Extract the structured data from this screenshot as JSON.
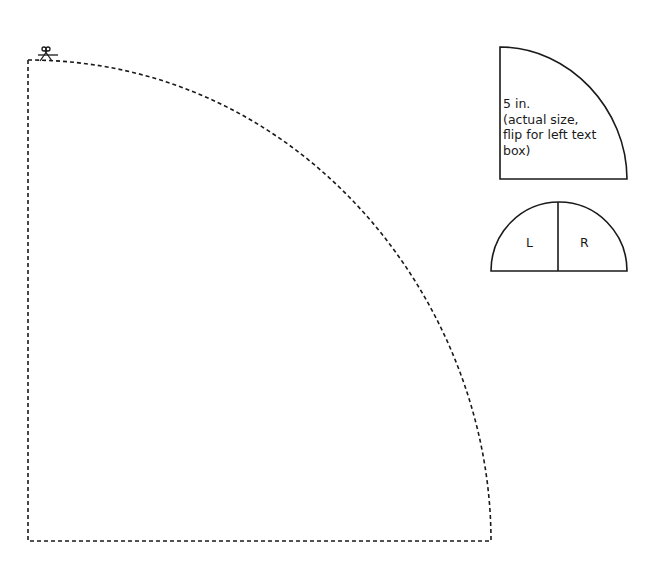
{
  "pattern": {
    "large_template": {
      "shape": "quarter-circle",
      "outline": "dashed",
      "cut_marker_icon": "scissors-icon"
    },
    "small_template": {
      "shape": "quarter-circle",
      "outline": "solid",
      "label_line1": "5 in.",
      "label_line2": "(actual size,",
      "label_line3": "flip for left text",
      "label_line4": "box)"
    },
    "half_circle_template": {
      "shape": "half-circle",
      "outline": "solid",
      "left_label": "L",
      "right_label": "R"
    },
    "colors": {
      "line": "#1a1a1a",
      "background": "#ffffff"
    }
  }
}
